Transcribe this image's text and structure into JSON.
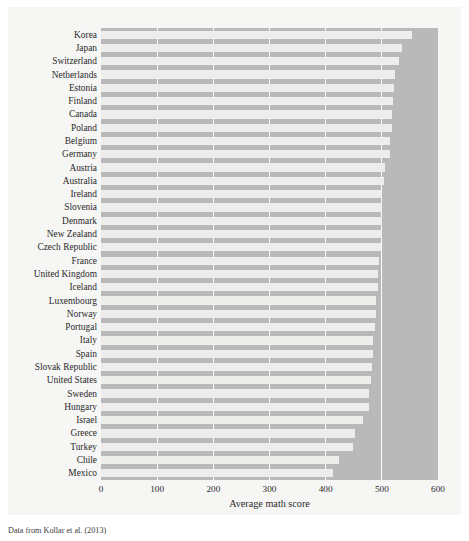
{
  "figure": {
    "caption": "Data from Kollar et al. (2013)",
    "panel_color": "#b9b9b9",
    "bar_color": "#ededeb",
    "grid_color": "#fdfdfd",
    "card_color": "#f6f6f5"
  },
  "chart_data": {
    "type": "bar",
    "orientation": "horizontal",
    "title": "",
    "xlabel": "Average math score",
    "ylabel": "",
    "xlim": [
      0,
      600
    ],
    "xticks": [
      0,
      100,
      200,
      300,
      400,
      500,
      600
    ],
    "xticklabels": [
      "0",
      "100",
      "200",
      "300",
      "400",
      "500",
      "600"
    ],
    "grid": true,
    "grid_axis": "x",
    "legend": false,
    "sorted": "descending",
    "categories": [
      "Korea",
      "Japan",
      "Switzerland",
      "Netherlands",
      "Estonia",
      "Finland",
      "Canada",
      "Poland",
      "Belgium",
      "Germany",
      "Austria",
      "Australia",
      "Ireland",
      "Slovenia",
      "Denmark",
      "New Zealand",
      "Czech Republic",
      "France",
      "United Kingdom",
      "Iceland",
      "Luxembourg",
      "Norway",
      "Portugal",
      "Italy",
      "Spain",
      "Slovak Republic",
      "United States",
      "Sweden",
      "Hungary",
      "Israel",
      "Greece",
      "Turkey",
      "Chile",
      "Mexico"
    ],
    "values": [
      554,
      536,
      531,
      523,
      521,
      519,
      518,
      518,
      515,
      514,
      506,
      504,
      501,
      501,
      500,
      500,
      499,
      495,
      494,
      493,
      490,
      489,
      487,
      485,
      484,
      482,
      481,
      478,
      477,
      466,
      453,
      448,
      423,
      413
    ]
  }
}
